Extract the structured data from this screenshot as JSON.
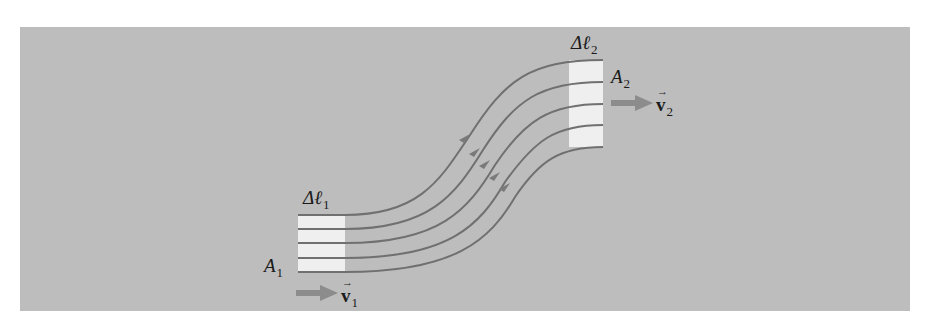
{
  "figure": {
    "background_color": "#bdbdbd",
    "page_color": "#ffffff",
    "streamline_color": "#707070",
    "arrow_color": "#8c8c8c",
    "volume_element_color": "#efefef",
    "labels": {
      "delta_l1": {
        "symbol": "Δℓ",
        "subscript": "1"
      },
      "area_1": {
        "symbol": "A",
        "subscript": "1"
      },
      "velocity_1": {
        "symbol": "v",
        "subscript": "1",
        "accent": "→"
      },
      "delta_l2": {
        "symbol": "Δℓ",
        "subscript": "2"
      },
      "area_2": {
        "symbol": "A",
        "subscript": "2"
      },
      "velocity_2": {
        "symbol": "v",
        "subscript": "2",
        "accent": "→"
      }
    },
    "streamline_count": 5
  }
}
